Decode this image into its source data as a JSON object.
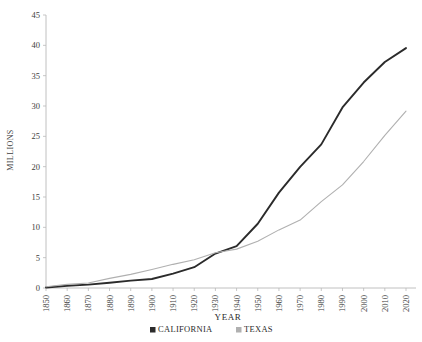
{
  "chart_data": {
    "type": "line",
    "title": "",
    "xlabel": "YEAR",
    "ylabel": "MILLIONS",
    "x": [
      1850,
      1860,
      1870,
      1880,
      1890,
      1900,
      1910,
      1920,
      1930,
      1940,
      1950,
      1960,
      1970,
      1980,
      1990,
      2000,
      2010,
      2020
    ],
    "categories": [
      "1850",
      "1860",
      "1870",
      "1880",
      "1890",
      "1900",
      "1910",
      "1920",
      "1930",
      "1940",
      "1950",
      "1960",
      "1970",
      "1980",
      "1990",
      "2000",
      "2010",
      "2020"
    ],
    "xlim": [
      1850,
      2020
    ],
    "ylim": [
      0,
      45
    ],
    "yticks": [
      0,
      5,
      10,
      15,
      20,
      25,
      30,
      35,
      40,
      45
    ],
    "grid": false,
    "legend_position": "bottom",
    "series": [
      {
        "name": "CALIFORNIA",
        "color": "#2b2b2b",
        "values": [
          0.09,
          0.38,
          0.56,
          0.86,
          1.21,
          1.49,
          2.38,
          3.43,
          5.68,
          6.91,
          10.59,
          15.72,
          19.97,
          23.67,
          29.76,
          33.87,
          37.25,
          39.54
        ]
      },
      {
        "name": "TEXAS",
        "color": "#b0b0b0",
        "values": [
          0.21,
          0.6,
          0.82,
          1.59,
          2.24,
          3.05,
          3.9,
          4.66,
          5.82,
          6.41,
          7.71,
          9.58,
          11.2,
          14.23,
          16.99,
          20.85,
          25.15,
          29.15
        ]
      }
    ]
  },
  "axis": {
    "y_title": "MILLIONS",
    "x_title": "YEAR",
    "y_tick_labels": [
      "0",
      "5",
      "10",
      "15",
      "20",
      "25",
      "30",
      "35",
      "40",
      "45"
    ],
    "x_tick_labels": [
      "1850",
      "1860",
      "1870",
      "1880",
      "1890",
      "1900",
      "1910",
      "1920",
      "1930",
      "1940",
      "1950",
      "1960",
      "1970",
      "1980",
      "1990",
      "2000",
      "2010",
      "2020"
    ]
  },
  "legend": {
    "items": [
      {
        "label": "CALIFORNIA",
        "color": "#2b2b2b"
      },
      {
        "label": "TEXAS",
        "color": "#b0b0b0"
      }
    ]
  }
}
